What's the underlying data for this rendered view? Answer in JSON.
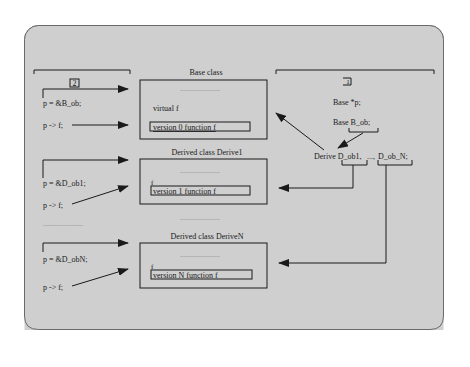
{
  "colors": {
    "panel_bg": "#cfcfcf",
    "panel_border": "#6a6a6a",
    "line": "#1a1a1a"
  },
  "left_bracket": {
    "label": "2"
  },
  "right_bracket": {
    "label": "1"
  },
  "declarations": {
    "pointer": "Base *p;",
    "base_object": "Base B_ob;",
    "derived_objects_prefix": "Derive D_ob1,",
    "derived_objects_sep": "...,",
    "derived_objects_last": "D_ob_N;"
  },
  "statements": [
    {
      "assign": "p = &B_ob;",
      "call": "p -> f;"
    },
    {
      "assign": "p = &D_ob1;",
      "call": "p -> f;"
    },
    {
      "assign": "p = &D_obN;",
      "call": "p -> f;"
    }
  ],
  "statements_ellipsis": "……………………",
  "classes": [
    {
      "title": "Base class",
      "dots": "……………………",
      "member": "virtual f",
      "function": "version 0 function f"
    },
    {
      "title": "Derived class Derive1",
      "dots": "……………………",
      "member": "f",
      "function": "version 1 function f"
    },
    {
      "title": "Derived class DeriveN",
      "dots": "……………………",
      "member": "f",
      "function": "version N function f"
    }
  ],
  "classes_ellipsis": "……………………"
}
